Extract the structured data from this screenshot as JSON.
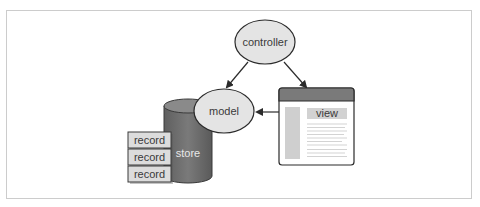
{
  "diagram": {
    "type": "MVC architecture",
    "nodes": {
      "controller": {
        "label": "controller",
        "shape": "ellipse"
      },
      "model": {
        "label": "model",
        "shape": "ellipse"
      },
      "view": {
        "label": "view",
        "shape": "window"
      },
      "store": {
        "label": "store",
        "shape": "cylinder"
      },
      "records": [
        {
          "label": "record"
        },
        {
          "label": "record"
        },
        {
          "label": "record"
        }
      ]
    },
    "edges": [
      {
        "from": "controller",
        "to": "model"
      },
      {
        "from": "controller",
        "to": "view"
      },
      {
        "from": "view",
        "to": "model"
      }
    ],
    "colors": {
      "ellipse_fill": "#e4e4e4",
      "store_fill": "#6e6e6e",
      "record_fill": "#dcdcdc",
      "window_header": "#7a7a7a",
      "window_sidebar": "#cfcfcf",
      "stroke": "#2b2b2b",
      "frame": "#cccccc"
    }
  }
}
